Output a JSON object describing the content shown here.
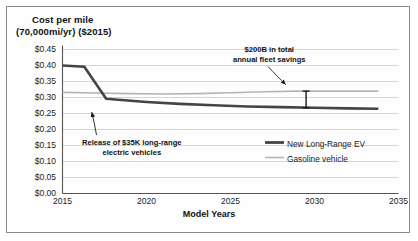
{
  "chart_data": {
    "type": "line",
    "title": "Cost per mile (70,000mi/yr) ($2015)",
    "title_line1": "Cost per mile",
    "title_line2": "(70,000mi/yr) ($2015)",
    "xlabel": "Model Years",
    "ylabel": "Cost per mile (70,000mi/yr) ($2015)",
    "xlim": [
      2015,
      2035
    ],
    "ylim": [
      0.0,
      0.45
    ],
    "grid": "horizontal",
    "legend_position": "inside-lower-right",
    "x_ticks": [
      "2015",
      "2020",
      "2025",
      "2030",
      "2035"
    ],
    "x_tick_values": [
      2015,
      2020,
      2025,
      2030,
      2035
    ],
    "y_ticks": [
      "$0.00",
      "$0.05",
      "$0.10",
      "$0.15",
      "$0.20",
      "$0.25",
      "$0.30",
      "$0.35",
      "$0.40",
      "$0.45"
    ],
    "y_tick_values": [
      0.0,
      0.05,
      0.1,
      0.15,
      0.2,
      0.25,
      0.3,
      0.35,
      0.4,
      0.45
    ],
    "series": [
      {
        "name": "New Long-Range EV",
        "color": "#444444",
        "width": 2.6,
        "x": [
          2015,
          2016.3,
          2017.6,
          2018.5,
          2020,
          2022,
          2024,
          2026,
          2028,
          2030,
          2032,
          2033.8
        ],
        "values": [
          0.4,
          0.396,
          0.296,
          0.292,
          0.286,
          0.28,
          0.276,
          0.272,
          0.27,
          0.268,
          0.266,
          0.265
        ]
      },
      {
        "name": "Gasoline vehicle",
        "color": "#b4b4b4",
        "width": 1.6,
        "x": [
          2015,
          2017,
          2019,
          2021,
          2023,
          2025,
          2027,
          2029,
          2031,
          2033.8
        ],
        "values": [
          0.316,
          0.314,
          0.312,
          0.311,
          0.312,
          0.315,
          0.318,
          0.32,
          0.32,
          0.32
        ]
      }
    ],
    "legend": [
      {
        "label": "New Long-Range EV",
        "color": "#444444",
        "style": "thick-line"
      },
      {
        "label": "Gasoline vehicle",
        "color": "#b4b4b4",
        "style": "thin-line"
      }
    ],
    "annotations": [
      {
        "name": "release-annotation",
        "line1": "Release of $35K long-range",
        "line2": "electric vehicles",
        "points_to_x": 2017.0,
        "points_to_y": 0.252
      },
      {
        "name": "savings-annotation",
        "line1": "$200B in total",
        "line2": "annual fleet savings",
        "points_to_x": 2029.5,
        "points_to_y": 0.33
      }
    ],
    "markers": [
      {
        "name": "savings-error-bar",
        "type": "vertical-range-bar",
        "x": 2029.5,
        "y_top": 0.32,
        "y_bottom": 0.268,
        "color": "#1a1a1a"
      }
    ]
  }
}
